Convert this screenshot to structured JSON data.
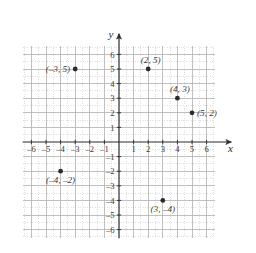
{
  "figure": {
    "title": "",
    "background_color": "#ffffff",
    "axis_color": "#2b2b2b",
    "grid_minor_color": "#c9c9c9",
    "grid_major_color": "#b0b0b0",
    "point_color": "#2b2b2b",
    "label_color": "#3a3a3a"
  },
  "chart_data": {
    "type": "scatter",
    "title": "",
    "xlabel": "x",
    "ylabel": "y",
    "xlim": [
      -6.6,
      6.6
    ],
    "ylim": [
      -6.6,
      6.6
    ],
    "grid": true,
    "grid_step": 0.5,
    "major_step": 1,
    "legend": "none",
    "x_ticks": [
      -6,
      -5,
      -4,
      -3,
      -2,
      -1,
      1,
      2,
      3,
      4,
      5,
      6
    ],
    "y_ticks": [
      -6,
      -5,
      -4,
      -3,
      -2,
      -1,
      1,
      2,
      3,
      4,
      5,
      6
    ],
    "x_tick_labels": [
      "–6",
      "–5",
      "–4",
      "–3",
      "–2",
      "–1",
      "1",
      "2",
      "3",
      "4",
      "5",
      "6"
    ],
    "y_tick_labels": [
      "–6",
      "–5",
      "–4",
      "–3",
      "–2",
      "–1",
      "1",
      "2",
      "3",
      "4",
      "5",
      "6"
    ],
    "points": [
      {
        "x": -3,
        "y": 5,
        "label": "(–3, 5)",
        "label_pos": "left"
      },
      {
        "x": 2,
        "y": 5,
        "label": "(2, 5)",
        "label_pos": "above-left"
      },
      {
        "x": 4,
        "y": 3,
        "label": "(4, 3)",
        "label_pos": "above-left"
      },
      {
        "x": 5,
        "y": 2,
        "label": "(5, 2)",
        "label_pos": "right"
      },
      {
        "x": -4,
        "y": -2,
        "label": "(–4, –2)",
        "label_pos": "below"
      },
      {
        "x": 3,
        "y": -4,
        "label": "(3, –4)",
        "label_pos": "below"
      }
    ]
  },
  "axes": {
    "x_axis_name": "x",
    "y_axis_name": "y"
  }
}
